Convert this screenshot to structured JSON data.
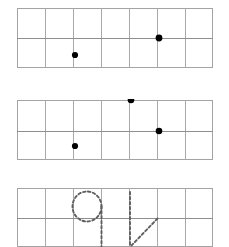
{
  "worksheet": {
    "title": "Handwriting practice grid worksheet",
    "background_color": "#ffffff",
    "grid_line_color": "#a9a9a9",
    "grid_border_color": "#9a9a9a",
    "dot_color": "#000000",
    "trace_color": "#6b6b6b",
    "width": 229,
    "height": 247,
    "rows": [
      {
        "id": "row-1",
        "name": "practice-row-1",
        "x": 17,
        "y": 8,
        "width": 196,
        "height": 60,
        "columns": 7,
        "cell_width": 28,
        "midline_y_offset": 30,
        "dots": [
          {
            "name": "start-dot-1",
            "x_offset": 58,
            "y_offset": 47,
            "radius": 3.1,
            "position": "lower-row-on-vertical-line"
          },
          {
            "name": "start-dot-2",
            "x_offset": 142,
            "y_offset": 30,
            "radius": 3.4,
            "position": "midline-intersection"
          }
        ],
        "traces": []
      },
      {
        "id": "row-2",
        "name": "practice-row-2",
        "x": 17,
        "y": 99,
        "width": 196,
        "height": 60,
        "columns": 7,
        "cell_width": 28,
        "midline_y_offset": 31,
        "dots": [
          {
            "name": "start-dot-3",
            "x_offset": 114,
            "y_offset": 0,
            "radius": 3.3,
            "position": "top-edge-on-vertical-line"
          },
          {
            "name": "start-dot-4",
            "x_offset": 142,
            "y_offset": 31,
            "radius": 3.3,
            "position": "midline-intersection"
          },
          {
            "name": "start-dot-5",
            "x_offset": 58,
            "y_offset": 46,
            "radius": 3.1,
            "position": "lower-row-on-vertical-line"
          }
        ],
        "traces": []
      },
      {
        "id": "row-3",
        "name": "practice-row-3",
        "x": 17,
        "y": 188,
        "width": 196,
        "height": 59,
        "columns": 7,
        "cell_width": 28,
        "midline_y_offset": 30,
        "dots": [],
        "traces": [
          {
            "name": "dashed-glyph-nine",
            "glyph": "9",
            "description": "dashed oval with descending vertical stroke"
          },
          {
            "name": "dashed-glyph-four",
            "glyph": "4",
            "description": "dashed vertical stroke with diagonal"
          }
        ]
      }
    ]
  }
}
